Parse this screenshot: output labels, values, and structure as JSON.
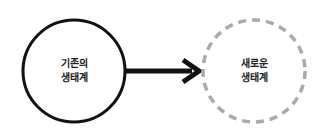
{
  "diagram": {
    "nodes": [
      {
        "id": "existing",
        "line1": "기존의",
        "line2": "생태계",
        "style": "solid",
        "stroke": "#111111"
      },
      {
        "id": "new",
        "line1": "새로운",
        "line2": "생태계",
        "style": "dashed",
        "stroke": "#aaaaaa"
      }
    ],
    "edge": {
      "from": "existing",
      "to": "new",
      "color": "#111111"
    }
  }
}
